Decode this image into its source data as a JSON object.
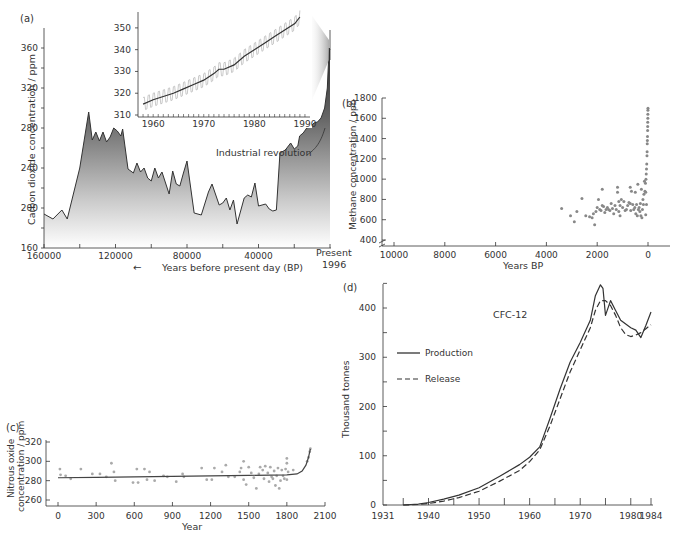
{
  "chart_data": [
    {
      "panel": "(a)",
      "type": "area",
      "xlabel": "Years before present day (BP)",
      "ylabel": "Carbon dioxide concentration / ppm",
      "x_ticks": [
        "160000",
        "120000",
        "80000",
        "40000",
        "Present 1996"
      ],
      "y_ticks": [
        160,
        200,
        240,
        280,
        320,
        360
      ],
      "ylim": [
        160,
        380
      ],
      "xlim": [
        160000,
        0
      ],
      "annotation": "Industrial revolution",
      "x": [
        160000,
        155000,
        150000,
        147000,
        140000,
        135000,
        133000,
        131000,
        129000,
        127000,
        125000,
        123000,
        121000,
        119000,
        117000,
        116000,
        113000,
        110000,
        108000,
        106000,
        104000,
        102000,
        100000,
        98000,
        96000,
        94000,
        90000,
        88000,
        86000,
        84000,
        82000,
        80000,
        76000,
        72000,
        68000,
        66000,
        62000,
        60000,
        58000,
        56000,
        54000,
        52000,
        48000,
        46000,
        44000,
        42000,
        40000,
        38000,
        36000,
        34000,
        32000,
        30000,
        28000,
        25000,
        22000,
        20000,
        18000,
        17000,
        15000,
        13000,
        11000,
        9000,
        7000,
        5000,
        3000,
        1500,
        500,
        0
      ],
      "values": [
        194,
        189,
        198,
        189,
        240,
        296,
        268,
        276,
        267,
        276,
        266,
        271,
        280,
        277,
        272,
        279,
        239,
        235,
        245,
        236,
        240,
        230,
        227,
        240,
        230,
        236,
        214,
        237,
        224,
        222,
        235,
        247,
        195,
        193,
        216,
        224,
        203,
        205,
        210,
        198,
        208,
        184,
        210,
        213,
        211,
        225,
        202,
        203,
        204,
        199,
        197,
        198,
        255,
        258,
        265,
        259,
        262,
        272,
        275,
        280,
        281,
        285,
        286,
        290,
        300,
        320,
        360,
        358
      ],
      "inset": {
        "type": "line",
        "x_ticks": [
          1960,
          1970,
          1980,
          1990
        ],
        "y_ticks": [
          310,
          320,
          330,
          340,
          350
        ],
        "ylim": [
          309,
          357
        ],
        "xlim": [
          1957,
          1991
        ],
        "trend_x": [
          1958,
          1960,
          1962,
          1964,
          1966,
          1968,
          1970,
          1972,
          1973,
          1974,
          1976,
          1978,
          1980,
          1982,
          1984,
          1986,
          1988,
          1989
        ],
        "trend_values": [
          315,
          317,
          318.5,
          320,
          322,
          324,
          326,
          329,
          331,
          331,
          333,
          337,
          340,
          343,
          346,
          349,
          352,
          355
        ],
        "seasonal_amplitude": 3
      }
    },
    {
      "panel": "(b)",
      "type": "scatter",
      "xlabel": "Years BP",
      "ylabel": "Methane concentration / ppb",
      "x_ticks": [
        10000,
        8000,
        6000,
        4000,
        2000,
        0
      ],
      "y_ticks": [
        400,
        600,
        800,
        1000,
        1200,
        1400,
        1600,
        1800
      ],
      "xlim": [
        10500,
        -800
      ],
      "ylim": [
        380,
        1800
      ],
      "points": [
        [
          3400,
          710
        ],
        [
          3050,
          640
        ],
        [
          2900,
          580
        ],
        [
          2800,
          680
        ],
        [
          2600,
          810
        ],
        [
          2450,
          640
        ],
        [
          2300,
          630
        ],
        [
          2200,
          620
        ],
        [
          2150,
          660
        ],
        [
          2100,
          550
        ],
        [
          2050,
          680
        ],
        [
          2000,
          720
        ],
        [
          1950,
          800
        ],
        [
          1900,
          700
        ],
        [
          1850,
          690
        ],
        [
          1800,
          900
        ],
        [
          1800,
          740
        ],
        [
          1750,
          730
        ],
        [
          1700,
          670
        ],
        [
          1650,
          700
        ],
        [
          1600,
          720
        ],
        [
          1550,
          700
        ],
        [
          1500,
          690
        ],
        [
          1450,
          760
        ],
        [
          1400,
          710
        ],
        [
          1350,
          660
        ],
        [
          1300,
          740
        ],
        [
          1250,
          700
        ],
        [
          1200,
          920
        ],
        [
          1200,
          870
        ],
        [
          1150,
          780
        ],
        [
          1150,
          680
        ],
        [
          1100,
          640
        ],
        [
          1100,
          740
        ],
        [
          1050,
          800
        ],
        [
          1000,
          720
        ],
        [
          950,
          780
        ],
        [
          900,
          690
        ],
        [
          850,
          700
        ],
        [
          800,
          740
        ],
        [
          750,
          770
        ],
        [
          700,
          920
        ],
        [
          700,
          760
        ],
        [
          680,
          690
        ],
        [
          650,
          880
        ],
        [
          600,
          750
        ],
        [
          560,
          700
        ],
        [
          520,
          720
        ],
        [
          500,
          870
        ],
        [
          480,
          660
        ],
        [
          450,
          750
        ],
        [
          420,
          640
        ],
        [
          400,
          950
        ],
        [
          380,
          700
        ],
        [
          350,
          720
        ],
        [
          320,
          680
        ],
        [
          300,
          760
        ],
        [
          280,
          640
        ],
        [
          260,
          900
        ],
        [
          240,
          620
        ],
        [
          220,
          700
        ],
        [
          200,
          800
        ],
        [
          180,
          750
        ],
        [
          160,
          850
        ],
        [
          140,
          980
        ],
        [
          120,
          880
        ],
        [
          100,
          960
        ],
        [
          90,
          870
        ],
        [
          80,
          1000
        ],
        [
          70,
          1050
        ],
        [
          60,
          1100
        ],
        [
          50,
          1150
        ],
        [
          40,
          1230
        ],
        [
          35,
          1270
        ],
        [
          30,
          1350
        ],
        [
          25,
          1380
        ],
        [
          20,
          1420
        ],
        [
          15,
          1480
        ],
        [
          12,
          1520
        ],
        [
          10,
          1560
        ],
        [
          7,
          1600
        ],
        [
          5,
          1640
        ],
        [
          3,
          1680
        ],
        [
          1,
          1700
        ],
        [
          60,
          750
        ],
        [
          90,
          650
        ]
      ]
    },
    {
      "panel": "(c)",
      "type": "scatter",
      "xlabel": "Year",
      "ylabel": "Nitrous oxide concentration / ppm",
      "x_ticks": [
        0,
        300,
        600,
        900,
        1200,
        1500,
        1800,
        2100
      ],
      "y_ticks": [
        260,
        280,
        300,
        320
      ],
      "xlim": [
        -50,
        2100
      ],
      "ylim": [
        252,
        322
      ],
      "trend_x": [
        0,
        300,
        600,
        900,
        1200,
        1500,
        1800,
        1880,
        1920,
        1950,
        1970,
        1985
      ],
      "trend_values": [
        283,
        283.5,
        284,
        284.5,
        285,
        285.5,
        286,
        287,
        290,
        296,
        304,
        313
      ],
      "points": [
        [
          15,
          292
        ],
        [
          20,
          286
        ],
        [
          60,
          285
        ],
        [
          100,
          282
        ],
        [
          180,
          292
        ],
        [
          270,
          287
        ],
        [
          330,
          287
        ],
        [
          380,
          284
        ],
        [
          420,
          298
        ],
        [
          440,
          289
        ],
        [
          450,
          280
        ],
        [
          590,
          278
        ],
        [
          620,
          292
        ],
        [
          630,
          278
        ],
        [
          680,
          292
        ],
        [
          700,
          281
        ],
        [
          720,
          289
        ],
        [
          760,
          280
        ],
        [
          830,
          285
        ],
        [
          860,
          284
        ],
        [
          930,
          279
        ],
        [
          980,
          287
        ],
        [
          990,
          284
        ],
        [
          1130,
          293
        ],
        [
          1170,
          281
        ],
        [
          1210,
          281
        ],
        [
          1230,
          293
        ],
        [
          1290,
          289
        ],
        [
          1320,
          296
        ],
        [
          1340,
          284
        ],
        [
          1390,
          284
        ],
        [
          1430,
          289
        ],
        [
          1440,
          293
        ],
        [
          1460,
          300
        ],
        [
          1460,
          281
        ],
        [
          1480,
          276
        ],
        [
          1500,
          294
        ],
        [
          1520,
          288
        ],
        [
          1540,
          283
        ],
        [
          1560,
          272
        ],
        [
          1580,
          287
        ],
        [
          1590,
          294
        ],
        [
          1610,
          291
        ],
        [
          1620,
          282
        ],
        [
          1630,
          295
        ],
        [
          1650,
          288
        ],
        [
          1660,
          279
        ],
        [
          1670,
          294
        ],
        [
          1680,
          284
        ],
        [
          1690,
          282
        ],
        [
          1700,
          290
        ],
        [
          1710,
          275
        ],
        [
          1720,
          285
        ],
        [
          1730,
          293
        ],
        [
          1740,
          272
        ],
        [
          1750,
          280
        ],
        [
          1760,
          291
        ],
        [
          1770,
          285
        ],
        [
          1780,
          282
        ],
        [
          1790,
          292
        ],
        [
          1800,
          298
        ],
        [
          1800,
          303
        ],
        [
          1800,
          281
        ],
        [
          1810,
          289
        ],
        [
          1850,
          291
        ],
        [
          1960,
          300
        ],
        [
          1970,
          304
        ],
        [
          1980,
          310
        ],
        [
          1985,
          313
        ]
      ]
    },
    {
      "panel": "(d)",
      "type": "line",
      "title": "CFC-12",
      "xlabel": "",
      "ylabel": "Thousand tonnes",
      "x_ticks": [
        1931,
        1940,
        1950,
        1960,
        1970,
        1980,
        1984
      ],
      "y_ticks": [
        0,
        100,
        200,
        300,
        400
      ],
      "xlim": [
        1931,
        1985
      ],
      "ylim": [
        0,
        450
      ],
      "legend": [
        "Production",
        "Release"
      ],
      "series": [
        {
          "name": "Production",
          "style": "solid",
          "x": [
            1935,
            1938,
            1940,
            1943,
            1946,
            1950,
            1954,
            1958,
            1960,
            1962,
            1964,
            1966,
            1968,
            1970,
            1972,
            1973,
            1974,
            1974.5,
            1975,
            1976,
            1977,
            1978,
            1980,
            1981,
            1982,
            1983,
            1984
          ],
          "values": [
            0,
            2,
            5,
            12,
            20,
            35,
            58,
            82,
            97,
            118,
            175,
            235,
            290,
            330,
            375,
            425,
            447,
            440,
            385,
            415,
            395,
            375,
            360,
            355,
            340,
            365,
            392
          ]
        },
        {
          "name": "Release",
          "style": "dashed",
          "x": [
            1935,
            1938,
            1940,
            1943,
            1946,
            1950,
            1954,
            1958,
            1960,
            1962,
            1964,
            1966,
            1968,
            1970,
            1972,
            1973,
            1974,
            1975,
            1976,
            1977,
            1978,
            1979,
            1980,
            1981,
            1982,
            1983,
            1984
          ],
          "values": [
            0,
            1,
            3,
            8,
            15,
            28,
            48,
            70,
            88,
            112,
            160,
            215,
            270,
            315,
            360,
            395,
            415,
            415,
            405,
            385,
            360,
            346,
            342,
            345,
            350,
            358,
            366
          ]
        }
      ]
    }
  ],
  "labels": {
    "panel_a": "(a)",
    "panel_b": "(b)",
    "panel_c": "(c)",
    "panel_d": "(d)",
    "a_ylabel": "Carbon dioxide concentration / ppm",
    "a_xlabel": "Years before present day (BP)",
    "a_arrow": "←",
    "a_present": "Present",
    "a_year": "1996",
    "a_annotation": "Industrial revolution",
    "b_ylabel": "Methane concentration / ppb",
    "b_xlabel": "Years BP",
    "c_ylabel_1": "Nitrous oxide",
    "c_ylabel_2": "concentration / ppm",
    "c_xlabel": "Year",
    "d_ylabel": "Thousand tonnes",
    "d_title": "CFC-12",
    "d_legend_production": "Production",
    "d_legend_release": "Release"
  }
}
